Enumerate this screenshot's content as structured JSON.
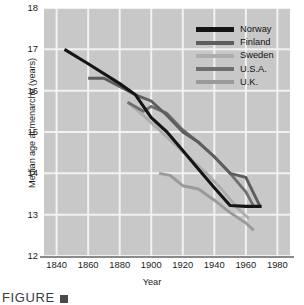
{
  "caption": {
    "text": "FIGURE",
    "marker_icon": "figure-number-box"
  },
  "axes": {
    "y_title": "Median age at menarche (years)",
    "x_title": "Year",
    "y_ticks": [
      "12",
      "13",
      "14",
      "15",
      "16",
      "17",
      "18"
    ],
    "x_ticks": [
      "1840",
      "1860",
      "1880",
      "1900",
      "1920",
      "1940",
      "1960",
      "1980"
    ]
  },
  "legend": {
    "entries": [
      {
        "label": "Norway",
        "color": "#151515"
      },
      {
        "label": "Finland",
        "color": "#5d5d5d"
      },
      {
        "label": "Sweden",
        "color": "#adadad"
      },
      {
        "label": "U.S.A.",
        "color": "#6f6f6f"
      },
      {
        "label": "U.K.",
        "color": "#9a9a9a"
      }
    ]
  },
  "colors": {
    "plot_background": "#c8c8c8",
    "gridline": "#f2f2f2",
    "axis_line": "#8a8a8a",
    "text": "#1a1a1a"
  },
  "chart_data": {
    "type": "line",
    "title": "",
    "xlabel": "Year",
    "ylabel": "Median age at menarche (years)",
    "xlim": [
      1832,
      1988
    ],
    "ylim": [
      12,
      18
    ],
    "grid": true,
    "legend_position": "top-right",
    "xticks": [
      1840,
      1860,
      1880,
      1900,
      1920,
      1940,
      1960,
      1980
    ],
    "yticks": [
      12,
      13,
      14,
      15,
      16,
      17,
      18
    ],
    "series": [
      {
        "name": "Norway",
        "color": "#151515",
        "x": [
          1845,
          1860,
          1880,
          1890,
          1900,
          1910,
          1920,
          1930,
          1940,
          1950,
          1960,
          1970
        ],
        "y": [
          17.0,
          16.65,
          16.17,
          15.9,
          15.35,
          15.0,
          14.55,
          14.1,
          13.65,
          13.22,
          13.2,
          13.2
        ]
      },
      {
        "name": "Finland",
        "color": "#5d5d5d",
        "x": [
          1860,
          1870,
          1880,
          1890,
          1900,
          1910,
          1920,
          1930,
          1940,
          1950,
          1960,
          1969
        ],
        "y": [
          16.3,
          16.3,
          16.1,
          15.9,
          15.75,
          15.4,
          15.0,
          14.75,
          14.4,
          14.0,
          13.9,
          13.2
        ]
      },
      {
        "name": "Sweden",
        "color": "#adadad",
        "x": [
          1885,
          1895,
          1905,
          1915,
          1925,
          1935,
          1945,
          1955,
          1962
        ],
        "y": [
          15.72,
          15.4,
          15.05,
          14.7,
          14.35,
          14.0,
          13.6,
          13.15,
          12.9
        ]
      },
      {
        "name": "U.S.A.",
        "color": "#6f6f6f",
        "x": [
          1885,
          1895,
          1900,
          1910,
          1920,
          1930,
          1940,
          1950,
          1960,
          1965
        ],
        "y": [
          15.72,
          15.5,
          15.62,
          15.45,
          15.05,
          14.75,
          14.4,
          14.0,
          13.55,
          13.2
        ]
      },
      {
        "name": "U.K.",
        "color": "#9a9a9a",
        "x": [
          1905,
          1912,
          1920,
          1930,
          1940,
          1950,
          1960,
          1965
        ],
        "y": [
          14.0,
          13.95,
          13.7,
          13.62,
          13.35,
          13.05,
          12.8,
          12.62
        ]
      }
    ]
  }
}
